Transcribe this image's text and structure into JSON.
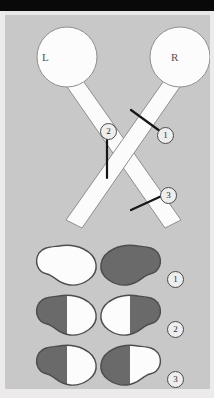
{
  "figure": {
    "background_color": "#c8c8c8",
    "nerve_color": "#fbfbfb",
    "nerve_outline_color": "#8a8a8a",
    "lesion_line_color": "#1a1a1a",
    "field_normal_color": "#fcfcfc",
    "field_defect_color": "#6a6a6a",
    "field_outline_color": "#4d4d4d"
  },
  "pathway": {
    "eyes": [
      {
        "id": "left-eye",
        "label": "L",
        "cx": 62,
        "cy": 42,
        "r": 30
      },
      {
        "id": "right-eye",
        "label": "R",
        "cx": 175,
        "cy": 42,
        "r": 30
      }
    ],
    "lesions": [
      {
        "number": "1",
        "site": "right-optic-nerve"
      },
      {
        "number": "2",
        "site": "optic-chiasm"
      },
      {
        "number": "3",
        "site": "right-optic-tract"
      }
    ]
  },
  "visual_fields": {
    "rows": [
      {
        "number": "1",
        "left_eye": {
          "defect": "none",
          "dark_side": "none"
        },
        "right_eye": {
          "defect": "total-blind",
          "dark_side": "all"
        }
      },
      {
        "number": "2",
        "left_eye": {
          "defect": "temporal-hemianopia",
          "dark_side": "left"
        },
        "right_eye": {
          "defect": "temporal-hemianopia",
          "dark_side": "right"
        }
      },
      {
        "number": "3",
        "left_eye": {
          "defect": "homonymous-hemianopia",
          "dark_side": "left"
        },
        "right_eye": {
          "defect": "homonymous-hemianopia",
          "dark_side": "left"
        }
      }
    ]
  }
}
